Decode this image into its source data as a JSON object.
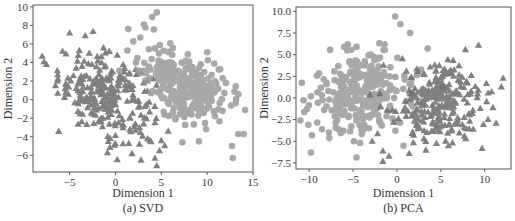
{
  "chart_data": [
    {
      "type": "scatter",
      "title": "",
      "caption": "(a) SVD",
      "xlabel": "Dimension 1",
      "ylabel": "Dimension 2",
      "xlim": [
        -9,
        15
      ],
      "ylim": [
        -7.8,
        10.2
      ],
      "xticks": [
        -5,
        0,
        5,
        10,
        15
      ],
      "xtick_labels": [
        "−5",
        "0",
        "5",
        "10",
        "15"
      ],
      "yticks": [
        -6,
        -4,
        -2,
        0,
        2,
        4,
        6,
        8,
        10
      ],
      "ytick_labels": [
        "−6",
        "−4",
        "−2",
        "0",
        "2",
        "4",
        "6",
        "8",
        "10"
      ],
      "grid": false,
      "legend": null,
      "series": [
        {
          "name": "class-triangle",
          "marker": "triangle",
          "color": "#6b6b6b",
          "cluster": {
            "cx": -1.0,
            "cy": 0.5,
            "sx": 2.6,
            "sy": 2.3,
            "rho": -0.35,
            "n": 260
          },
          "outliers": [
            [
              -8.0,
              4.7
            ],
            [
              -7.8,
              4.1
            ],
            [
              -5.0,
              7.2
            ],
            [
              -3.3,
              6.9
            ],
            [
              -6.2,
              -3.4
            ],
            [
              -6.3,
              2.7
            ],
            [
              -5.5,
              1.2
            ],
            [
              4.5,
              -7.1
            ],
            [
              4.3,
              -6.3
            ],
            [
              1.8,
              -5.8
            ],
            [
              5.0,
              -4.4
            ],
            [
              -0.1,
              -4.9
            ],
            [
              4.8,
              -5.5
            ],
            [
              3.5,
              -4.2
            ]
          ]
        },
        {
          "name": "class-circle",
          "marker": "circle",
          "color": "#9a9a9a",
          "cluster": {
            "cx": 8.0,
            "cy": 1.2,
            "sx": 2.3,
            "sy": 2.0,
            "rho": -0.45,
            "n": 280
          },
          "outliers": [
            [
              4.5,
              9.4
            ],
            [
              4.0,
              8.9
            ],
            [
              3.1,
              8.1
            ],
            [
              1.4,
              7.6
            ],
            [
              2.7,
              6.7
            ],
            [
              1.3,
              5.3
            ],
            [
              13.1,
              -0.4
            ],
            [
              13.4,
              -3.7
            ],
            [
              14.0,
              -3.7
            ],
            [
              12.7,
              -5.0
            ],
            [
              12.8,
              -6.3
            ],
            [
              7.3,
              -4.6
            ],
            [
              9.1,
              -4.5
            ],
            [
              11.7,
              2.3
            ],
            [
              10.0,
              5.1
            ]
          ]
        }
      ]
    },
    {
      "type": "scatter",
      "title": "",
      "caption": "(b) PCA",
      "xlabel": "Dimension 1",
      "ylabel": "Dimension 2",
      "xlim": [
        -11.5,
        13
      ],
      "ylim": [
        -8.2,
        10.5
      ],
      "xticks": [
        -10,
        -5,
        0,
        5,
        10
      ],
      "xtick_labels": [
        "−10",
        "−5",
        "0",
        "5",
        "10"
      ],
      "yticks": [
        -7.5,
        -5.0,
        -2.5,
        0.0,
        2.5,
        5.0,
        7.5,
        10.0
      ],
      "ytick_labels": [
        "−7.5",
        "−5.0",
        "−2.5",
        "0.0",
        "2.5",
        "5.0",
        "7.5",
        "10.0"
      ],
      "grid": false,
      "legend": null,
      "series": [
        {
          "name": "class-circle",
          "marker": "circle",
          "color": "#9a9a9a",
          "cluster": {
            "cx": -4.2,
            "cy": 0.6,
            "sx": 2.6,
            "sy": 2.2,
            "rho": 0.15,
            "n": 280
          },
          "outliers": [
            [
              -0.2,
              9.4
            ],
            [
              0.4,
              8.5
            ],
            [
              1.5,
              7.5
            ],
            [
              -6.0,
              5.9
            ],
            [
              -4.6,
              5.9
            ],
            [
              -2.0,
              6.3
            ],
            [
              -1.4,
              6.2
            ],
            [
              3.5,
              5.7
            ],
            [
              -11.0,
              -2.6
            ],
            [
              -10.1,
              -3.1
            ],
            [
              -9.7,
              -4.3
            ],
            [
              -9.8,
              -6.3
            ],
            [
              -9.8,
              0.2
            ],
            [
              -4.9,
              -5.0
            ],
            [
              -4.2,
              -5.2
            ]
          ]
        },
        {
          "name": "class-triangle",
          "marker": "triangle",
          "color": "#6b6b6b",
          "cluster": {
            "cx": 4.3,
            "cy": -0.6,
            "sx": 2.5,
            "sy": 2.1,
            "rho": 0.1,
            "n": 260
          },
          "outliers": [
            [
              9.3,
              6.1
            ],
            [
              7.8,
              5.6
            ],
            [
              12.1,
              2.3
            ],
            [
              11.9,
              1.3
            ],
            [
              10.2,
              1.7
            ],
            [
              10.4,
              0.6
            ],
            [
              9.7,
              -5.8
            ],
            [
              -2.2,
              -4.1
            ],
            [
              -1.6,
              -6.1
            ],
            [
              -1.6,
              -7.3
            ],
            [
              -0.9,
              -6.7
            ],
            [
              1.4,
              -6.4
            ],
            [
              3.3,
              -6.0
            ],
            [
              8.7,
              -3.6
            ],
            [
              9.5,
              -1.2
            ]
          ]
        }
      ]
    }
  ]
}
